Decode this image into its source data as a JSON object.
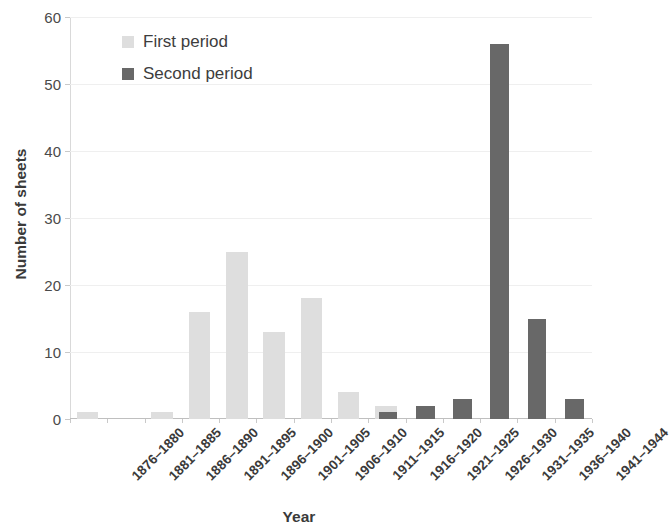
{
  "chart_data": {
    "type": "bar",
    "title": "",
    "xlabel": "Year",
    "ylabel": "Number of sheets",
    "ylim": [
      0,
      60
    ],
    "yticks": [
      0,
      10,
      20,
      30,
      40,
      50,
      60
    ],
    "ytick_labels": [
      "0",
      "10",
      "20",
      "30",
      "40",
      "50",
      "60"
    ],
    "grid": true,
    "legend_position": "top-left-inside",
    "categories": [
      "1876–1880",
      "1881–1885",
      "1886–1890",
      "1891–1895",
      "1896–1900",
      "1901–1905",
      "1906–1910",
      "1911–1915",
      "1916–1920",
      "1921–1925",
      "1926–1930",
      "1931–1935",
      "1936–1940",
      "1941–1944"
    ],
    "series": [
      {
        "name": "First period",
        "color": "#dedede",
        "values": [
          1,
          0,
          1,
          16,
          25,
          13,
          18,
          4,
          2,
          0,
          0,
          0,
          0,
          0
        ]
      },
      {
        "name": "Second period",
        "color": "#686868",
        "values": [
          0,
          0,
          0,
          0,
          0,
          0,
          0,
          0,
          1,
          2,
          3,
          56,
          15,
          3
        ]
      }
    ]
  },
  "axes": {
    "y_title": "Number of sheets",
    "x_title": "Year"
  }
}
